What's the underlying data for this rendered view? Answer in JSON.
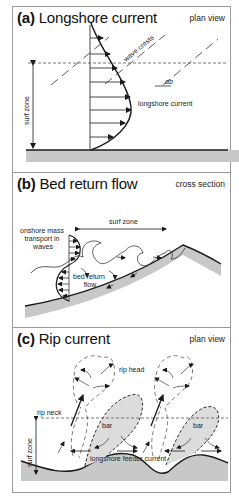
{
  "panels": [
    {
      "id": "a",
      "letter": "(a)",
      "title": "Longshore current",
      "view": "plan view",
      "labels": {
        "wave_crests": "wave crests",
        "angle": "αb",
        "longshore_current": "longshore current",
        "surf_zone": "surf zone"
      }
    },
    {
      "id": "b",
      "letter": "(b)",
      "title": "Bed return flow",
      "view": "cross section",
      "labels": {
        "surf_zone": "surf zone",
        "onshore_1": "onshore mass",
        "onshore_2": "transport in",
        "onshore_3": "waves",
        "bed_return_1": "bed return",
        "bed_return_2": "flow"
      }
    },
    {
      "id": "c",
      "letter": "(c)",
      "title": "Rip current",
      "view": "plan view",
      "labels": {
        "rip_head": "rip head",
        "rip_neck": "rip neck",
        "bar_1": "bar",
        "bar_2": "bar",
        "surf_zone": "surf zone",
        "feeder": "longshore feeder current"
      }
    }
  ],
  "colors": {
    "line": "#1a1a1a",
    "shore_fill": "#c8c8c8",
    "bar_fill": "#dcdcdc",
    "dashed": "#555555",
    "border": "#9a9a9a"
  }
}
